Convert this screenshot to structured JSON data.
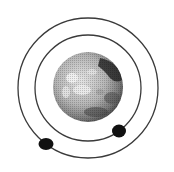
{
  "diagram": {
    "planet": {
      "label": "planet"
    },
    "orbits": [
      {
        "label": "inner-orbit"
      },
      {
        "label": "outer-orbit"
      }
    ],
    "moons": [
      {
        "label": "moon-inner",
        "orbit": "inner-orbit"
      },
      {
        "label": "moon-outer",
        "orbit": "outer-orbit"
      }
    ],
    "colors": {
      "background": "#ffffff",
      "orbit_stroke": "#3a3a3a",
      "moon_fill": "#111111",
      "planet_light": "#dcdcdc",
      "planet_mid": "#a8a8a8",
      "planet_dark": "#2a2a2a"
    }
  }
}
